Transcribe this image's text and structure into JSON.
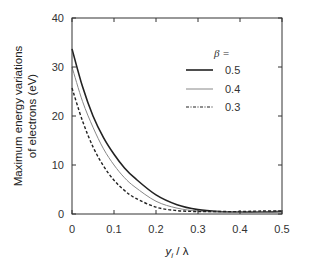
{
  "chart_data": {
    "type": "line",
    "title": "",
    "xlabel": "y_i / λ",
    "ylabel": "Maximum energy variations of electrons (eV)",
    "ylabel_lines": [
      "Maximum energy variations",
      "of electrons (eV)"
    ],
    "xlim": [
      0,
      0.5
    ],
    "ylim": [
      0,
      40
    ],
    "xticks": [
      0,
      0.1,
      0.2,
      0.3,
      0.4,
      0.5
    ],
    "xtick_labels": [
      "0",
      "0.1",
      "0.2",
      "0.3",
      "0.4",
      "0.5"
    ],
    "yticks": [
      0,
      10,
      20,
      30,
      40
    ],
    "ytick_labels": [
      "0",
      "10",
      "20",
      "30",
      "40"
    ],
    "grid": false,
    "legend": {
      "title": "β =",
      "position": "upper right",
      "entries": [
        "0.5",
        "0.4",
        "0.3"
      ]
    },
    "x": [
      0,
      0.025,
      0.05,
      0.075,
      0.1,
      0.125,
      0.15,
      0.2,
      0.25,
      0.3,
      0.35,
      0.4,
      0.45,
      0.5
    ],
    "series": [
      {
        "name": "0.5",
        "style": "solid",
        "color": "#222222",
        "width": 1.6,
        "values": [
          33.7,
          26.0,
          20.0,
          15.6,
          12.2,
          9.4,
          7.3,
          3.9,
          1.9,
          0.9,
          0.5,
          0.4,
          0.4,
          0.5
        ]
      },
      {
        "name": "0.4",
        "style": "solid",
        "color": "#888888",
        "width": 1.0,
        "values": [
          30.0,
          23.0,
          17.7,
          13.3,
          10.0,
          7.4,
          5.5,
          2.6,
          1.2,
          0.6,
          0.4,
          0.4,
          0.4,
          0.4
        ]
      },
      {
        "name": "0.3",
        "style": "dashed",
        "color": "#222222",
        "width": 1.4,
        "values": [
          25.7,
          19.0,
          13.7,
          9.8,
          6.9,
          4.8,
          3.3,
          1.4,
          0.7,
          0.5,
          0.5,
          0.5,
          0.6,
          0.6
        ]
      }
    ]
  }
}
